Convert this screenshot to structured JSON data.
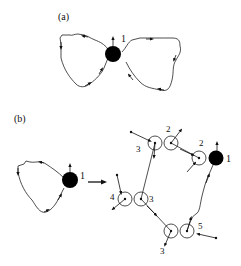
{
  "panels": {
    "a": {
      "label": "(a)",
      "node_label": "1"
    },
    "b": {
      "label": "(b)",
      "left_node_label": "1",
      "node_labels": {
        "top_left_pair": "3",
        "top_pair": "2",
        "right_pair": "2",
        "big_node": "1",
        "mid_left": "4",
        "mid_right": "3",
        "bottom_left": "3",
        "bottom_right": "5"
      }
    }
  },
  "colors": {
    "stroke": "#222222",
    "fill_node": "#000000"
  }
}
